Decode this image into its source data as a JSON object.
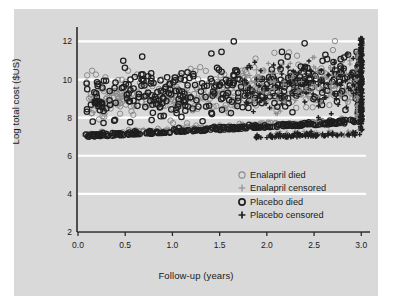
{
  "chart_data": {
    "type": "scatter",
    "title": "",
    "xlabel": "Follow-up (years)",
    "ylabel": "Log total cost ($US)",
    "xlim": [
      0.0,
      3.05
    ],
    "ylim": [
      2,
      12.6
    ],
    "xticks": [
      "0.0",
      "0.5",
      "1.0",
      "1.5",
      "2.0",
      "2.5",
      "3.0"
    ],
    "xtick_values": [
      0.0,
      0.5,
      1.0,
      1.5,
      2.0,
      2.5,
      3.0
    ],
    "yticks": [
      "2",
      "4",
      "6",
      "8",
      "10",
      "12"
    ],
    "ytick_values": [
      2,
      4,
      6,
      8,
      10,
      12
    ],
    "grid": "horizontal-white",
    "panel_color": "#d9d9d9",
    "grid_color": "#ffffff",
    "axis_color": "#2b2b2b",
    "legend_position": "center-right-lower",
    "series": [
      {
        "name": "Enalapril died",
        "marker": "circle-open",
        "color": "#8a8a8a",
        "n": 330
      },
      {
        "name": "Enalapril censored",
        "marker": "plus",
        "color": "#8a8a8a",
        "n": 150
      },
      {
        "name": "Placebo died",
        "marker": "circle-open-bold",
        "color": "#1f1f1f",
        "n": 330
      },
      {
        "name": "Placebo censored",
        "marker": "plus-bold",
        "color": "#1f1f1f",
        "n": 150
      }
    ]
  },
  "legend": {
    "items": [
      {
        "label": "Enalapril died",
        "marker": "circle-open-gray"
      },
      {
        "label": "Enalapril censored",
        "marker": "plus-gray"
      },
      {
        "label": "Placebo died",
        "marker": "circle-open-black"
      },
      {
        "label": "Placebo censored",
        "marker": "plus-black"
      }
    ]
  }
}
